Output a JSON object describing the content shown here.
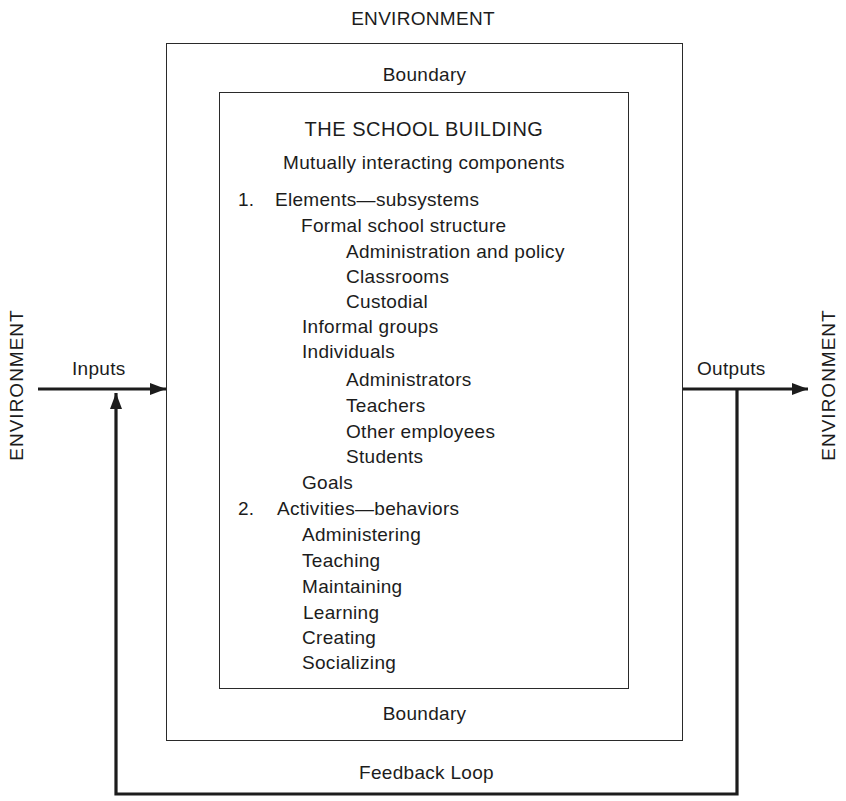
{
  "environment": {
    "top_label": "ENVIRONMENT",
    "left_label": "ENVIRONMENT",
    "right_label": "ENVIRONMENT"
  },
  "boundary": {
    "top_label": "Boundary",
    "bottom_label": "Boundary"
  },
  "flows": {
    "inputs_label": "Inputs",
    "outputs_label": "Outputs",
    "feedback_label": "Feedback Loop"
  },
  "system": {
    "title": "THE SCHOOL BUILDING",
    "subtitle": "Mutually interacting components",
    "sections": [
      {
        "number": "1.",
        "heading": "Elements—subsystems",
        "groups": [
          {
            "label": "Formal school structure",
            "items": [
              "Administration and policy",
              "Classrooms",
              "Custodial"
            ]
          },
          {
            "label": "Informal groups",
            "items": []
          },
          {
            "label": "Individuals",
            "items": [
              "Administrators",
              "Teachers",
              "Other employees",
              "Students"
            ]
          },
          {
            "label": "Goals",
            "items": []
          }
        ]
      },
      {
        "number": "2.",
        "heading": "Activities—behaviors",
        "items": [
          "Administering",
          "Teaching",
          "Maintaining",
          "Learning",
          "Creating",
          "Socializing"
        ]
      }
    ]
  },
  "colors": {
    "line": "#2a2a2a",
    "text": "#1c1c1c",
    "background": "#ffffff"
  }
}
